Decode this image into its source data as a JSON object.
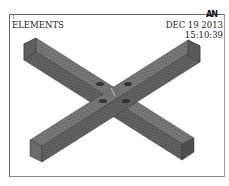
{
  "window": {
    "number": "1",
    "plot_label": "ELEMENTS",
    "logo": "AN",
    "date": "DEC 19 2013",
    "time": "15:10:39"
  },
  "model": {
    "description": "Meshed cross-shaped beam assembly (two intersecting rectangular beams) in isometric view",
    "mesh_color": "#6f6f6f",
    "edge_color": "#3a3a3a",
    "background": "#ffffff"
  }
}
